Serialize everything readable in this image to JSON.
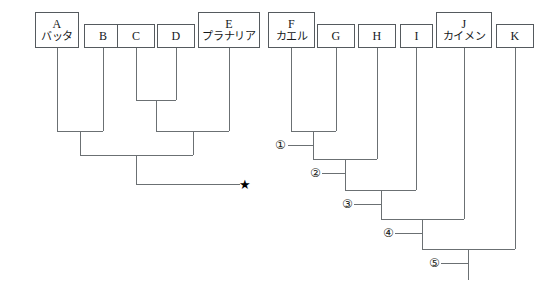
{
  "diagram": {
    "type": "cladogram",
    "title": "",
    "background_color": "#ffffff",
    "line_color": "#6b7073",
    "box_border_color": "#555a5e",
    "text_color": "#15181a",
    "taxa": [
      {
        "id": "A",
        "letter": "A",
        "name": "バッタ",
        "x": 35,
        "y": 12,
        "w": 44,
        "h": 36,
        "stem_x": 57
      },
      {
        "id": "B",
        "letter": "B",
        "name": "",
        "x": 84,
        "y": 24,
        "w": 38,
        "h": 24,
        "stem_x": 103
      },
      {
        "id": "C",
        "letter": "C",
        "name": "",
        "x": 117,
        "y": 24,
        "w": 38,
        "h": 24,
        "stem_x": 136
      },
      {
        "id": "D",
        "letter": "D",
        "name": "",
        "x": 157,
        "y": 24,
        "w": 38,
        "h": 24,
        "stem_x": 176
      },
      {
        "id": "E",
        "letter": "E",
        "name": "プラナリア",
        "x": 198,
        "y": 12,
        "w": 62,
        "h": 36,
        "stem_x": 229
      },
      {
        "id": "F",
        "letter": "F",
        "name": "カエル",
        "x": 268,
        "y": 12,
        "w": 47,
        "h": 36,
        "stem_x": 291
      },
      {
        "id": "G",
        "letter": "G",
        "name": "",
        "x": 317,
        "y": 24,
        "w": 38,
        "h": 24,
        "stem_x": 336
      },
      {
        "id": "H",
        "letter": "H",
        "name": "",
        "x": 358,
        "y": 24,
        "w": 38,
        "h": 24,
        "stem_x": 377
      },
      {
        "id": "I",
        "letter": "I",
        "name": "",
        "x": 400,
        "y": 24,
        "w": 33,
        "h": 24,
        "stem_x": 416
      },
      {
        "id": "J",
        "letter": "J",
        "name": "カイメン",
        "x": 436,
        "y": 12,
        "w": 56,
        "h": 36,
        "stem_x": 464
      },
      {
        "id": "K",
        "letter": "K",
        "name": "",
        "x": 496,
        "y": 24,
        "w": 38,
        "h": 24,
        "stem_x": 515
      }
    ],
    "nodes": [
      {
        "id": "n1",
        "label": "①",
        "label_x": 275,
        "label_y": 139,
        "join_y": 145,
        "lead_x": 288,
        "lead_y": 145
      },
      {
        "id": "n2",
        "label": "②",
        "label_x": 310,
        "label_y": 167,
        "join_y": 173,
        "lead_x": 322,
        "lead_y": 173
      },
      {
        "id": "n3",
        "label": "③",
        "label_x": 342,
        "label_y": 198,
        "join_y": 204,
        "lead_x": 354,
        "lead_y": 204
      },
      {
        "id": "n4",
        "label": "④",
        "label_x": 383,
        "label_y": 227,
        "join_y": 233,
        "lead_x": 395,
        "lead_y": 233
      },
      {
        "id": "n5",
        "label": "⑤",
        "label_x": 429,
        "label_y": 257,
        "join_y": 263,
        "lead_x": 441,
        "lead_y": 263
      }
    ],
    "star": {
      "glyph": "★",
      "x": 239,
      "y": 178
    },
    "left_tree_edges": [
      {
        "name": "A-stem",
        "x1": 57,
        "y1": 48,
        "x2": 57,
        "y2": 131
      },
      {
        "name": "B-stem",
        "x1": 103,
        "y1": 48,
        "x2": 103,
        "y2": 131
      },
      {
        "name": "AB-bar",
        "x1": 57,
        "y1": 131,
        "x2": 103,
        "y2": 131
      },
      {
        "name": "AB-stem",
        "x1": 80,
        "y1": 131,
        "x2": 80,
        "y2": 155
      },
      {
        "name": "C-stem",
        "x1": 136,
        "y1": 48,
        "x2": 136,
        "y2": 100
      },
      {
        "name": "D-stem",
        "x1": 176,
        "y1": 48,
        "x2": 176,
        "y2": 100
      },
      {
        "name": "CD-bar",
        "x1": 136,
        "y1": 100,
        "x2": 176,
        "y2": 100
      },
      {
        "name": "CD-stem",
        "x1": 156,
        "y1": 100,
        "x2": 156,
        "y2": 131
      },
      {
        "name": "E-stem",
        "x1": 229,
        "y1": 48,
        "x2": 229,
        "y2": 131
      },
      {
        "name": "CDE-bar",
        "x1": 156,
        "y1": 131,
        "x2": 229,
        "y2": 131
      },
      {
        "name": "CDE-stem",
        "x1": 193,
        "y1": 131,
        "x2": 193,
        "y2": 155
      },
      {
        "name": "root-bar",
        "x1": 80,
        "y1": 155,
        "x2": 193,
        "y2": 155
      },
      {
        "name": "root-stem",
        "x1": 136,
        "y1": 155,
        "x2": 136,
        "y2": 184
      },
      {
        "name": "star-bar",
        "x1": 136,
        "y1": 184,
        "x2": 240,
        "y2": 184
      }
    ],
    "right_tree_edges": [
      {
        "name": "F-stem",
        "x1": 291,
        "y1": 48,
        "x2": 291,
        "y2": 131
      },
      {
        "name": "G-stem",
        "x1": 336,
        "y1": 48,
        "x2": 336,
        "y2": 131
      },
      {
        "name": "FG-bar",
        "x1": 291,
        "y1": 131,
        "x2": 336,
        "y2": 131
      },
      {
        "name": "FG-stem",
        "x1": 313,
        "y1": 131,
        "x2": 313,
        "y2": 159
      },
      {
        "name": "n1-lead",
        "x1": 288,
        "y1": 145,
        "x2": 313,
        "y2": 145
      },
      {
        "name": "n2-bar",
        "x1": 313,
        "y1": 159,
        "x2": 377,
        "y2": 159
      },
      {
        "name": "H-stem",
        "x1": 377,
        "y1": 48,
        "x2": 377,
        "y2": 159
      },
      {
        "name": "FGH-stem",
        "x1": 345,
        "y1": 159,
        "x2": 345,
        "y2": 190
      },
      {
        "name": "n2-lead",
        "x1": 322,
        "y1": 173,
        "x2": 345,
        "y2": 173
      },
      {
        "name": "n3-bar",
        "x1": 345,
        "y1": 190,
        "x2": 416,
        "y2": 190
      },
      {
        "name": "I-stem",
        "x1": 416,
        "y1": 48,
        "x2": 416,
        "y2": 190
      },
      {
        "name": "FGHI-stem",
        "x1": 381,
        "y1": 190,
        "x2": 381,
        "y2": 219
      },
      {
        "name": "n3-lead",
        "x1": 354,
        "y1": 204,
        "x2": 381,
        "y2": 204
      },
      {
        "name": "n4-bar",
        "x1": 381,
        "y1": 219,
        "x2": 464,
        "y2": 219
      },
      {
        "name": "J-stem",
        "x1": 464,
        "y1": 48,
        "x2": 464,
        "y2": 219
      },
      {
        "name": "FGHIJ-stem",
        "x1": 422,
        "y1": 219,
        "x2": 422,
        "y2": 249
      },
      {
        "name": "n4-lead",
        "x1": 395,
        "y1": 233,
        "x2": 422,
        "y2": 233
      },
      {
        "name": "n5-bar",
        "x1": 422,
        "y1": 249,
        "x2": 515,
        "y2": 249
      },
      {
        "name": "K-stem",
        "x1": 515,
        "y1": 48,
        "x2": 515,
        "y2": 249
      },
      {
        "name": "root5-stem",
        "x1": 468,
        "y1": 249,
        "x2": 468,
        "y2": 280
      },
      {
        "name": "n5-lead",
        "x1": 441,
        "y1": 263,
        "x2": 468,
        "y2": 263
      }
    ]
  }
}
